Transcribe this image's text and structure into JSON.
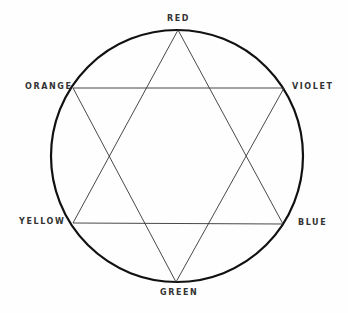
{
  "diagram": {
    "title": "",
    "labels": {
      "red": "RED",
      "violet": "VIOLET",
      "blue": "BLUE",
      "green": "GREEN",
      "yellow": "YELLOW",
      "orange": "ORANGE"
    },
    "colors": {
      "circle": "#111111",
      "lines": "#333333",
      "text": "#333333"
    }
  }
}
